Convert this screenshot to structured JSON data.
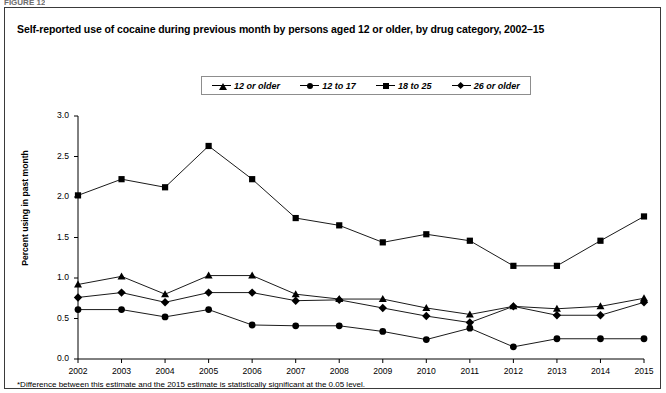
{
  "figure": {
    "top_label": "FIGURE 12",
    "title": "Self-reported use of cocaine during previous month by persons aged 12 or older, by drug category, 2002–15",
    "footnote": "*Difference between this estimate and the 2015 estimate is statistically significant at the 0.05 level."
  },
  "legend": {
    "items": [
      {
        "label": "12 or older",
        "marker": "triangle-marker",
        "color": "#000000"
      },
      {
        "label": "12 to 17",
        "marker": "circle-marker",
        "color": "#000000"
      },
      {
        "label": "18 to 25",
        "marker": "square-marker",
        "color": "#000000"
      },
      {
        "label": "26 or older",
        "marker": "diamond-marker",
        "color": "#000000"
      }
    ]
  },
  "axes": {
    "y_title": "Percent using in past month",
    "y_ticks": [
      "0.0",
      "0.5",
      "1.0",
      "1.5",
      "2.0",
      "2.5",
      "3.0"
    ],
    "x_ticks": [
      "2002",
      "2003",
      "2004",
      "2005",
      "2006",
      "2007",
      "2008",
      "2009",
      "2010",
      "2011",
      "2012",
      "2013",
      "2014",
      "2015"
    ]
  },
  "chart_data": {
    "type": "line",
    "title": "Self-reported use of cocaine during previous month by persons aged 12 or older, by drug category, 2002–15",
    "xlabel": "",
    "ylabel": "Percent using in past month",
    "x": [
      2002,
      2003,
      2004,
      2005,
      2006,
      2007,
      2008,
      2009,
      2010,
      2011,
      2012,
      2013,
      2014,
      2015
    ],
    "xlim": [
      2002,
      2015
    ],
    "ylim": [
      0.0,
      3.0
    ],
    "ytick_step": 0.5,
    "grid": false,
    "legend_position": "top-center",
    "series": [
      {
        "name": "12 or older",
        "marker": "triangle",
        "color": "#000000",
        "values": [
          0.92,
          1.02,
          0.8,
          1.03,
          1.03,
          0.8,
          0.74,
          0.74,
          0.63,
          0.55,
          0.65,
          0.62,
          0.65,
          0.75
        ]
      },
      {
        "name": "12 to 17",
        "marker": "circle",
        "color": "#000000",
        "values": [
          0.61,
          0.61,
          0.52,
          0.61,
          0.42,
          0.41,
          0.41,
          0.34,
          0.24,
          0.38,
          0.15,
          0.25,
          0.25,
          0.25
        ]
      },
      {
        "name": "18 to 25",
        "marker": "square",
        "color": "#000000",
        "values": [
          2.02,
          2.22,
          2.12,
          2.63,
          2.22,
          1.74,
          1.65,
          1.44,
          1.54,
          1.46,
          1.15,
          1.15,
          1.46,
          1.76
        ]
      },
      {
        "name": "26 or older",
        "marker": "diamond",
        "color": "#000000",
        "values": [
          0.76,
          0.82,
          0.7,
          0.82,
          0.82,
          0.72,
          0.73,
          0.63,
          0.53,
          0.45,
          0.65,
          0.54,
          0.54,
          0.7
        ]
      }
    ]
  },
  "plot_geometry": {
    "left_px": 73,
    "right_px": 639,
    "top_px": 108,
    "bottom_px": 351
  }
}
